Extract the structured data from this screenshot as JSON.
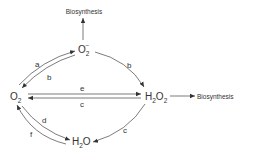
{
  "diagram": {
    "nodes": {
      "o2": {
        "main": "O",
        "sub": "2"
      },
      "superoxide": {
        "main": "O",
        "sub": "2",
        "sup": "−"
      },
      "h2o2": {
        "main1": "H",
        "sub1": "2",
        "main2": "O",
        "sub2": "2"
      },
      "h2o": {
        "main1": "H",
        "sub1": "2",
        "main2": "O"
      }
    },
    "outputs": {
      "biosynthesis_top": "Biosynthesis",
      "biosynthesis_right": "Biosynthesis"
    },
    "edge_labels": {
      "o2_to_superoxide": "a",
      "superoxide_to_o2": "b",
      "superoxide_to_h2o2": "b",
      "o2_to_h2o2": "e",
      "h2o2_to_o2": "c",
      "h2o2_to_h2o": "c",
      "o2_to_h2o": "d",
      "h2o_to_o2": "f"
    },
    "colors": {
      "ink": "#333333",
      "background": "#ffffff"
    }
  }
}
